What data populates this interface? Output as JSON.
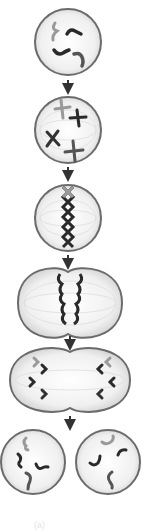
{
  "diagram": {
    "stages": [
      {
        "name": "prophase-early",
        "label": "Interphase / early prophase"
      },
      {
        "name": "prophase",
        "label": "Prophase"
      },
      {
        "name": "metaphase",
        "label": "Metaphase"
      },
      {
        "name": "anaphase",
        "label": "Anaphase"
      },
      {
        "name": "telophase",
        "label": "Telophase"
      },
      {
        "name": "cytokinesis",
        "label": "Daughter cells"
      }
    ],
    "colors": {
      "membrane": "#6b6b6b",
      "cytoplasm": "#f2f2f2",
      "chromosome_dark": "#2a2a2a",
      "chromosome_light": "#9a9a9a",
      "spindle": "#d8d8d8",
      "arrow": "#333333"
    },
    "caption": "(a)"
  }
}
